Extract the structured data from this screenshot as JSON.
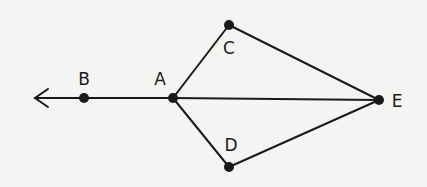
{
  "diagram": {
    "type": "geometry",
    "line_color": "#1a1a1a",
    "background": "#f4f4f2",
    "points": {
      "A": {
        "label": "A",
        "x": 173,
        "y": 98,
        "lx": 160,
        "ly": 85
      },
      "B": {
        "label": "B",
        "x": 84,
        "y": 98,
        "lx": 84,
        "ly": 85
      },
      "C": {
        "label": "C",
        "x": 229,
        "y": 25,
        "lx": 229,
        "ly": 54
      },
      "D": {
        "label": "D",
        "x": 229,
        "y": 167,
        "lx": 231,
        "ly": 151
      },
      "E": {
        "label": "E",
        "x": 379,
        "y": 100,
        "lx": 397,
        "ly": 107
      }
    },
    "ray": {
      "from": "A",
      "through": "B",
      "direction": "left",
      "arrow_tip": {
        "x": 34,
        "y": 98
      }
    },
    "segments": [
      [
        "A",
        "C"
      ],
      [
        "A",
        "D"
      ],
      [
        "A",
        "E"
      ],
      [
        "C",
        "E"
      ],
      [
        "D",
        "E"
      ]
    ]
  }
}
